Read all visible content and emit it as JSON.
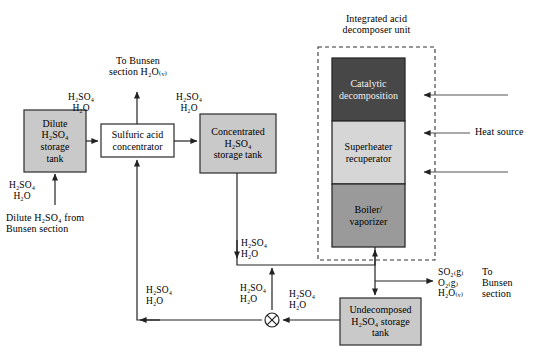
{
  "diagram": {
    "colors": {
      "tank_fill": "#c9c9c9",
      "white_fill": "#ffffff",
      "catalytic_fill": "#474747",
      "superheater_fill": "#d6d6d6",
      "boiler_fill": "#9a9a9a",
      "stroke": "#3a3a3a",
      "dashed_stroke": "#333333"
    }
  },
  "boxes": {
    "dilute_tank": {
      "label": "Dilute\nH₂SO₄\nstorage\ntank"
    },
    "concentrator": {
      "label": "Sulfuric acid\nconcentrator"
    },
    "concentrated_tank": {
      "label": "Concentrated\nH₂SO₄\nstorage tank"
    },
    "catalytic": {
      "label": "Catalytic\ndecomposition"
    },
    "superheater": {
      "label": "Superheater\nrecuperator"
    },
    "boiler": {
      "label": "Boiler/\nvaporizer"
    },
    "undecomposed_tank": {
      "label": "Undecomposed\nH₂SO₄ storage\ntank"
    }
  },
  "labels": {
    "unit_title": "Integrated acid\ndecomposer unit",
    "heat_source": "Heat source",
    "to_bunsen_top": "To Bunsen\nsection H₂O₍ᵥ₎",
    "stream_dilute_out": "H₂SO₄\nH₂O",
    "stream_conc_in": "H₂SO₄\nH₂O",
    "stream_feed_in": "H₂SO₄\nH₂O",
    "dilute_from_bunsen": "Dilute H₂SO₄ from\nBunsen section",
    "stream_conc_down": "H₂SO₄\nH₂O",
    "stream_return_left": "H₂SO₄\nH₂O",
    "stream_mixer_up": "H₂SO₄\nH₂O",
    "stream_undecomp_out": "H₂SO₄\nH₂O",
    "product_species": "SO₂₍g₎\nO₂₍g₎\nH₂O₍ᵥ₎",
    "product_dest": "To\nBunsen\nsection"
  }
}
